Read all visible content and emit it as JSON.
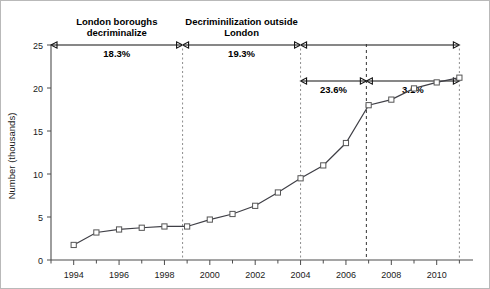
{
  "chart_data": {
    "type": "line",
    "title": "",
    "subtitle": "",
    "xlabel": "",
    "ylabel": "Number (thousands)",
    "xlim": [
      1993,
      2011.6
    ],
    "ylim": [
      0,
      25
    ],
    "grid": false,
    "legend": null,
    "x": [
      1994,
      1995,
      1996,
      1997,
      1998,
      1999,
      2000,
      2001,
      2002,
      2003,
      2004,
      2005,
      2006,
      2007,
      2008,
      2009,
      2010,
      2011
    ],
    "values": [
      1.75,
      3.2,
      3.55,
      3.75,
      3.9,
      3.9,
      4.7,
      5.35,
      6.3,
      7.85,
      9.5,
      11.0,
      13.6,
      18.0,
      18.65,
      19.95,
      20.65,
      21.2
    ],
    "series": [
      {
        "name": "Number (thousands)",
        "values": [
          1.75,
          3.2,
          3.55,
          3.75,
          3.9,
          3.9,
          4.7,
          5.35,
          6.3,
          7.85,
          9.5,
          11.0,
          13.6,
          18.0,
          18.65,
          19.95,
          20.65,
          21.2
        ],
        "marker": "open-square",
        "color": "#3f3f46"
      }
    ],
    "xticks": [
      1994,
      1996,
      1998,
      2000,
      2002,
      2004,
      2006,
      2008,
      2010
    ],
    "xticklabels": [
      "1994",
      "1996",
      "1998",
      "2000",
      "2002",
      "2004",
      "2006",
      "2008",
      "2010"
    ],
    "xminorticks": [
      1993,
      1995,
      1997,
      1999,
      2001,
      2003,
      2005,
      2007,
      2009,
      2011
    ],
    "yticks": [
      0,
      5,
      10,
      15,
      20,
      25
    ],
    "yticklabels": [
      "0",
      "5",
      "10",
      "15",
      "20",
      "25"
    ],
    "dividers": [
      {
        "name": "decriminalization-start",
        "x": 1998.8,
        "style": "dashed-grey"
      },
      {
        "name": "period-2004",
        "x": 2004.0,
        "style": "dashed-grey"
      },
      {
        "name": "period-2007",
        "x": 2006.9,
        "style": "dashed-dark"
      },
      {
        "name": "period-2011",
        "x": 2011.0,
        "style": "dashed-grey"
      }
    ],
    "annotations": [
      {
        "name": "london-boroughs-period",
        "label_lines": [
          "London boroughs",
          "decriminalize"
        ],
        "percent": "18.3%",
        "x_start": 1993.0,
        "x_end": 1998.8,
        "row": "top"
      },
      {
        "name": "decriminilization-outside-london-period",
        "label_lines": [
          "Decriminilization outside",
          "London"
        ],
        "percent": "19.3%",
        "x_start": 1998.8,
        "x_end": 2004.0,
        "row": "top"
      },
      {
        "name": "full-span-period",
        "label_lines": [],
        "percent": "",
        "x_start": 2004.0,
        "x_end": 2011.0,
        "row": "top"
      },
      {
        "name": "period-2004-2007",
        "label_lines": [],
        "percent": "23.6%",
        "x_start": 2004.0,
        "x_end": 2006.9,
        "row": "lower"
      },
      {
        "name": "period-2007-2011",
        "label_lines": [],
        "percent": "3.1%",
        "x_start": 2006.9,
        "x_end": 2011.0,
        "row": "lower"
      }
    ],
    "colors": {
      "line": "#3f3f46",
      "marker_fill": "#ffffff",
      "marker_stroke": "#555555",
      "axis": "#4d4d4d",
      "annotation": "#111111",
      "background": "#ffffff"
    }
  }
}
